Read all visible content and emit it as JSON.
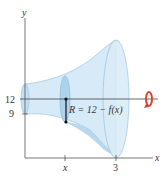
{
  "diagram": {
    "axes": {
      "y_label": "y",
      "x_label": "x",
      "y_ticks": [
        "12",
        "9"
      ],
      "x_ticks": [
        "x",
        "3"
      ]
    },
    "annotation": "R = 12 − f(x)",
    "axis_of_revolution_y": "12",
    "colors": {
      "solid_fill": "#cfe6f5",
      "solid_dark": "#9cc8e6",
      "rotation_arrow": "#d9432f",
      "axis": "#555555"
    }
  }
}
